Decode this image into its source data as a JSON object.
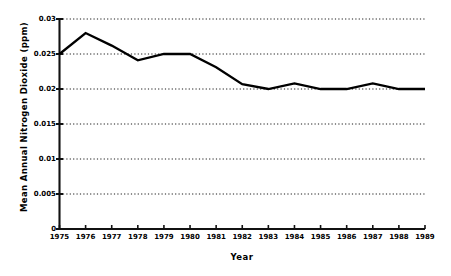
{
  "chart_data": {
    "type": "line",
    "title": "",
    "xlabel": "Year",
    "ylabel": "Mean Annual Nitrogen Dioxide (ppm)",
    "x": [
      1975,
      1976,
      1977,
      1978,
      1979,
      1980,
      1981,
      1982,
      1983,
      1984,
      1985,
      1986,
      1987,
      1988,
      1989
    ],
    "categories": [
      "1975",
      "1976",
      "1977",
      "1978",
      "1979",
      "1980",
      "1981",
      "1982",
      "1983",
      "1984",
      "1985",
      "1986",
      "1987",
      "1988",
      "1989"
    ],
    "values": [
      0.025,
      0.028,
      0.0262,
      0.0241,
      0.025,
      0.025,
      0.0231,
      0.0207,
      0.02,
      0.0208,
      0.02,
      0.02,
      0.0208,
      0.02,
      0.02
    ],
    "series": [
      {
        "name": "Mean Annual Nitrogen Dioxide",
        "values": [
          0.025,
          0.028,
          0.0262,
          0.0241,
          0.025,
          0.025,
          0.0231,
          0.0207,
          0.02,
          0.0208,
          0.02,
          0.02,
          0.0208,
          0.02,
          0.02
        ]
      }
    ],
    "ylim": [
      0,
      0.03
    ],
    "xlim": [
      1975,
      1989
    ],
    "yticks": [
      0,
      0.005,
      0.01,
      0.015,
      0.02,
      0.025,
      0.03
    ],
    "ytick_labels": [
      "0",
      "0.005",
      "0.01",
      "0.015",
      "0.02",
      "0.025",
      "0.03"
    ],
    "xticks": [
      1975,
      1976,
      1977,
      1978,
      1979,
      1980,
      1981,
      1982,
      1983,
      1984,
      1985,
      1986,
      1987,
      1988,
      1989
    ],
    "xtick_labels": [
      "1975",
      "1976",
      "1977",
      "1978",
      "1979",
      "1980",
      "1981",
      "1982",
      "1983",
      "1984",
      "1985",
      "1986",
      "1987",
      "1988",
      "1989"
    ],
    "grid": "horizontal-dotted",
    "legend": "none",
    "line_color": "#000000",
    "background_color": "#ffffff",
    "annotations": []
  }
}
